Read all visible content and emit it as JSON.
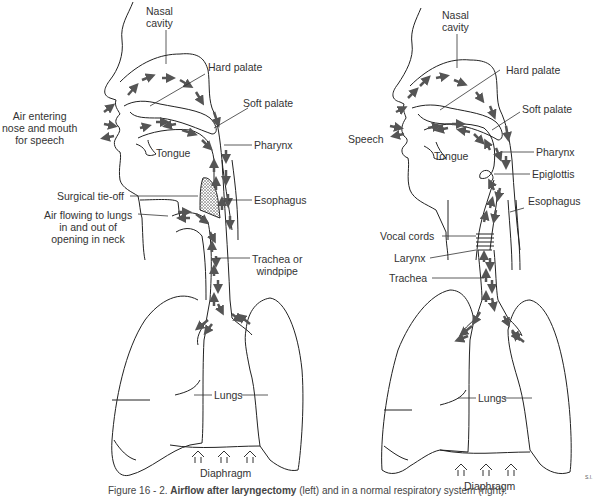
{
  "figure": {
    "caption_number": "Figure 16 - 2.",
    "caption_title": "Airflow after laryngectomy",
    "caption_rest": "(left) and in a normal respiratory system (right).",
    "artist_initials": "S.I.",
    "arrow_color": "#555555",
    "line_color": "#222222"
  },
  "left_panel": {
    "labels": {
      "nasal_cavity": "Nasal\ncavity",
      "hard_palate": "Hard palate",
      "soft_palate": "Soft palate",
      "air_entering": "Air entering\nnose and mouth\nfor speech",
      "tongue": "Tongue",
      "pharynx": "Pharynx",
      "surgical_tie_off": "Surgical tie-off",
      "esophagus": "Esophagus",
      "air_flowing": "Air flowing to lungs\nin and out of\nopening in neck",
      "trachea": "Trachea or\nwindpipe",
      "lungs": "Lungs",
      "diaphragm": "Diaphragm"
    }
  },
  "right_panel": {
    "labels": {
      "nasal_cavity": "Nasal\ncavity",
      "hard_palate": "Hard palate",
      "soft_palate": "Soft palate",
      "speech": "Speech",
      "tongue": "Tongue",
      "pharynx": "Pharynx",
      "epiglottis": "Epiglottis",
      "esophagus": "Esophagus",
      "vocal_cords": "Vocal cords",
      "larynx": "Larynx",
      "trachea": "Trachea",
      "lungs": "Lungs",
      "diaphragm": "Diaphragm"
    }
  }
}
